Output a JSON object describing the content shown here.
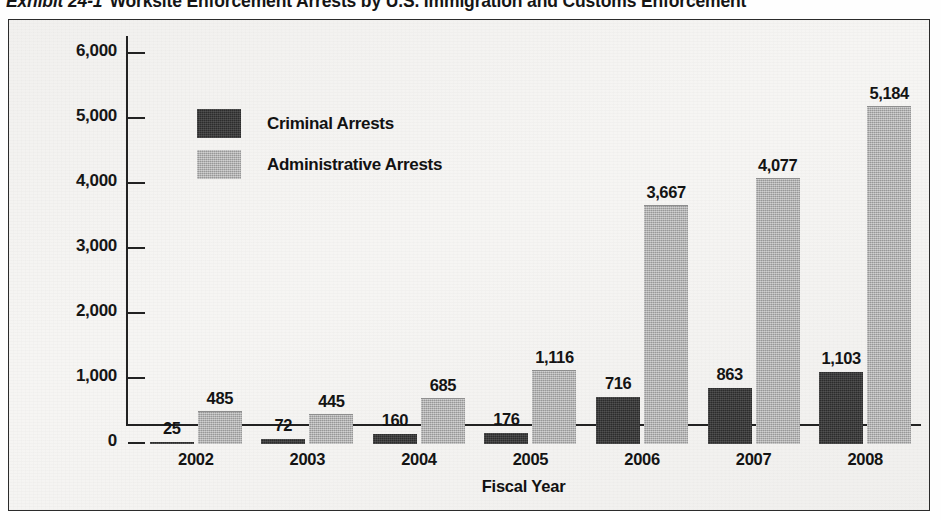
{
  "exhibit": {
    "bullet": "-",
    "number": "Exhibit 24-1",
    "title": "Worksite Enforcement Arrests by U.S. Immigration and Customs Enforcement"
  },
  "legend": {
    "items": [
      {
        "label": "Criminal Arrests",
        "key": "criminal",
        "color": "#2c2c2c"
      },
      {
        "label": "Administrative Arrests",
        "key": "administrative",
        "color": "#a9a9a9"
      }
    ]
  },
  "axes": {
    "y_ticks": [
      "6,000",
      "5,000",
      "4,000",
      "3,000",
      "2,000",
      "1,000",
      "0"
    ],
    "y_title": "Worksite Enforcement Arrests",
    "x_title": "Fiscal Year"
  },
  "chart_data": {
    "type": "bar",
    "title": "Worksite Enforcement Arrests by U.S. Immigration and Customs Enforcement",
    "xlabel": "Fiscal Year",
    "ylabel": "Worksite Enforcement Arrests",
    "ylim": [
      0,
      6000
    ],
    "ytick_step": 1000,
    "grid": false,
    "legend_position": "inside-upper-left",
    "categories": [
      "2002",
      "2003",
      "2004",
      "2005",
      "2006",
      "2007",
      "2008"
    ],
    "series": [
      {
        "name": "Criminal Arrests",
        "color": "#2c2c2c",
        "values": [
          25,
          72,
          160,
          176,
          716,
          863,
          1103
        ],
        "labels": [
          "25",
          "72",
          "160",
          "176",
          "716",
          "863",
          "1,103"
        ]
      },
      {
        "name": "Administrative Arrests",
        "color": "#a9a9a9",
        "values": [
          485,
          445,
          685,
          1116,
          3667,
          4077,
          5184
        ],
        "labels": [
          "485",
          "445",
          "685",
          "1,116",
          "3,667",
          "4,077",
          "5,184"
        ]
      }
    ]
  }
}
